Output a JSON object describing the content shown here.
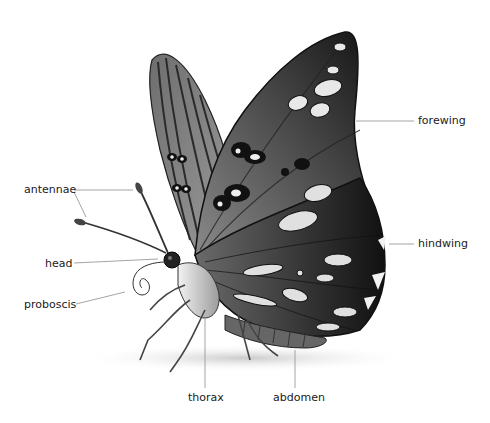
{
  "diagram": {
    "labels": {
      "antennae": "antennae",
      "head": "head",
      "proboscis": "proboscis",
      "forewing": "forewing",
      "hindwing": "hindwing",
      "thorax": "thorax",
      "abdomen": "abdomen"
    },
    "colors": {
      "leader_line": "#9a9a9a",
      "text": "#1a1a1a",
      "wing_dark": "#1e1e1e",
      "wing_mid": "#5a5a5a",
      "spot": "#e6e6e6"
    }
  }
}
